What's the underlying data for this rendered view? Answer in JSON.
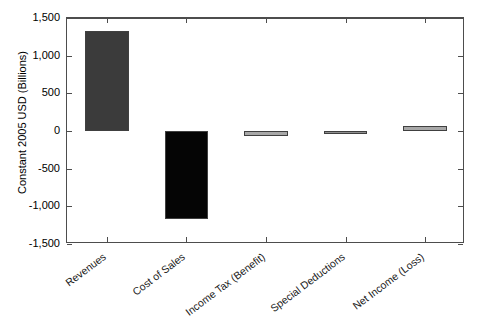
{
  "chart_data": {
    "type": "bar",
    "title": "",
    "subtitle": "",
    "xlabel": "",
    "ylabel": "Constant 2005 USD (Billions)",
    "categories": [
      "Revenues",
      "Cost of Sales",
      "Income Tax (Benefit)",
      "Special Deductions",
      "Net Income (Loss)"
    ],
    "values": [
      1330,
      -1170,
      -60,
      -5,
      70
    ],
    "bar_colors": [
      "#3b3b3b",
      "#050505",
      "#a8a8a8",
      "#8f8f8f",
      "#a8a8a8"
    ],
    "ylim": [
      -1500,
      1500
    ],
    "ytick_labels": [
      "1,500",
      "1,000",
      "500",
      "0",
      "-500",
      "-1,000",
      "-1,500"
    ],
    "ytick_values": [
      1500,
      1000,
      500,
      0,
      -500,
      -1000,
      -1500
    ],
    "grid": false,
    "legend": "none",
    "legend_position": "none",
    "axis_color": "#4d4d4d",
    "background_color": "#ffffff",
    "xtick_rotation_deg": -37
  },
  "figure": {
    "width": 485,
    "height": 325
  }
}
